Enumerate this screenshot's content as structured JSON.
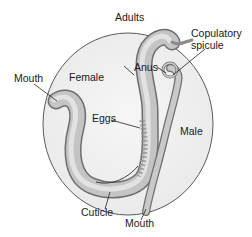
{
  "figure": {
    "title": "Adults",
    "labels": {
      "female": "Female",
      "male": "Male",
      "mouth_female": "Mouth",
      "eggs": "Eggs",
      "anus": "Anus",
      "copulatory_spicule_line1": "Copulatory",
      "copulatory_spicule_line2": "spicule",
      "cuticle": "Cuticle",
      "mouth_male": "Mouth"
    },
    "colors": {
      "circle_fill": "#f1f1f1",
      "circle_stroke": "#5a5a5a",
      "worm_fill": "#bdbdbd",
      "worm_dark": "#7d7d7d",
      "leader_line": "#222222"
    }
  }
}
